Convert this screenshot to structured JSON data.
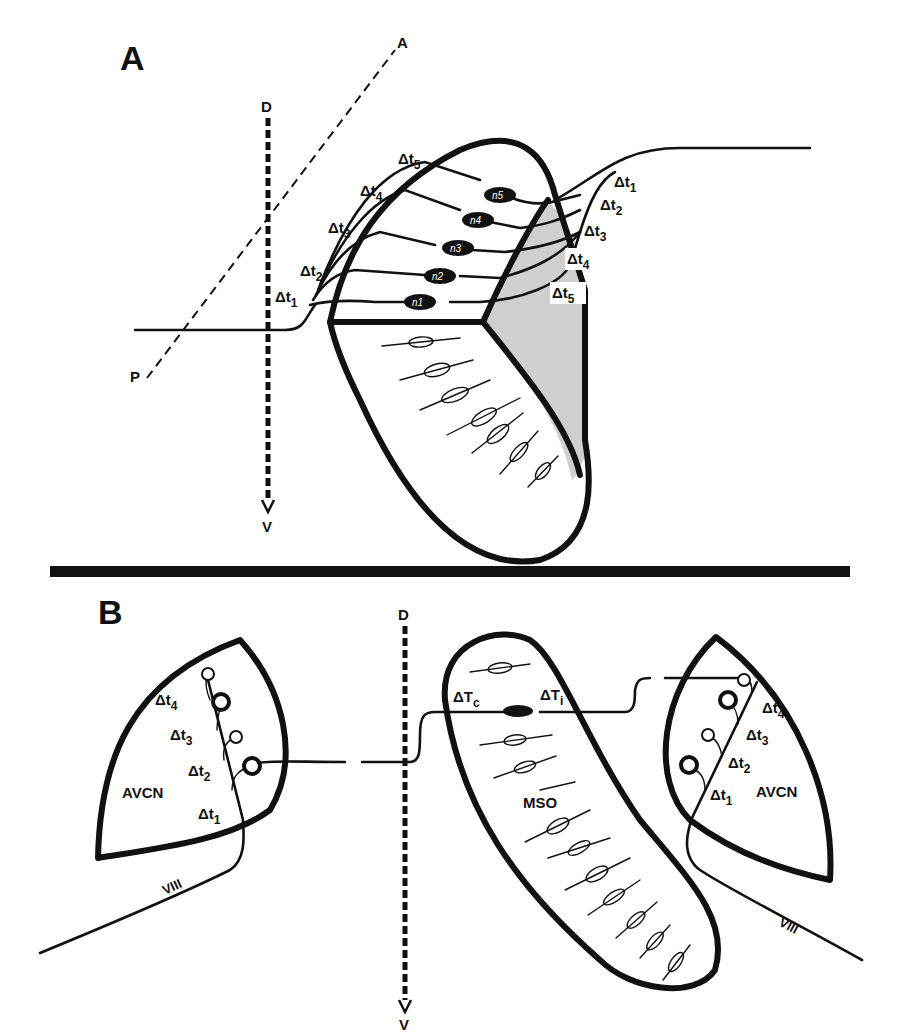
{
  "figure": {
    "colors": {
      "ink": "#111111",
      "background": "#ffffff",
      "shading": "#cfcfcf"
    },
    "panel_a": {
      "label": "A",
      "axes": {
        "dorsal": "D",
        "ventral": "V",
        "anterior": "A",
        "posterior": "P"
      },
      "left_delays": [
        {
          "base": "Δt",
          "sub": "1"
        },
        {
          "base": "Δt",
          "sub": "2"
        },
        {
          "base": "Δt",
          "sub": "3"
        },
        {
          "base": "Δt",
          "sub": "4"
        },
        {
          "base": "Δt",
          "sub": "5"
        }
      ],
      "right_delays": [
        {
          "base": "Δt",
          "sub": "1"
        },
        {
          "base": "Δt",
          "sub": "2"
        },
        {
          "base": "Δt",
          "sub": "3"
        },
        {
          "base": "Δt",
          "sub": "4"
        },
        {
          "base": "Δt",
          "sub": "5"
        }
      ],
      "neurons": [
        "n1",
        "n2",
        "n3",
        "n4",
        "n5"
      ]
    },
    "panel_b": {
      "label": "B",
      "axes": {
        "dorsal": "D",
        "ventral": "V"
      },
      "left_nucleus": {
        "name": "AVCN",
        "nerve": "VIII",
        "delays": [
          {
            "base": "Δt",
            "sub": "1"
          },
          {
            "base": "Δt",
            "sub": "2"
          },
          {
            "base": "Δt",
            "sub": "3"
          },
          {
            "base": "Δt",
            "sub": "4"
          }
        ]
      },
      "center_nucleus": {
        "name": "MSO",
        "contralateral_delay": {
          "base": "ΔT",
          "sub": "c"
        },
        "ipsilateral_delay": {
          "base": "ΔT",
          "sub": "i"
        }
      },
      "right_nucleus": {
        "name": "AVCN",
        "nerve": "VIII",
        "delays": [
          {
            "base": "Δt",
            "sub": "1"
          },
          {
            "base": "Δt",
            "sub": "2"
          },
          {
            "base": "Δt",
            "sub": "3"
          },
          {
            "base": "Δt",
            "sub": "4"
          }
        ]
      }
    }
  }
}
